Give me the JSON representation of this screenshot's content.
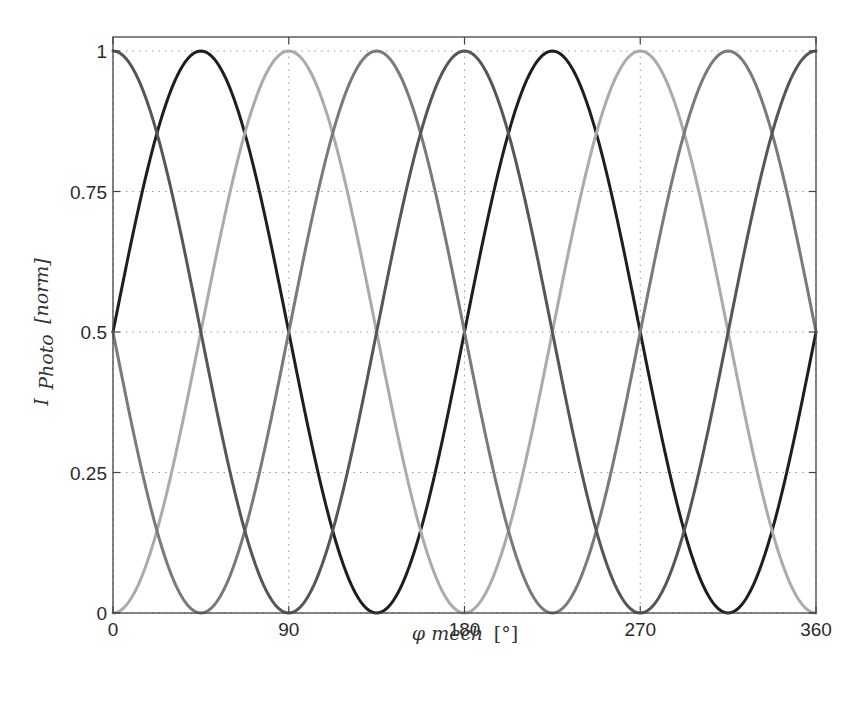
{
  "chart_data": {
    "type": "line",
    "title": "",
    "xlabel": "φ mech [°]",
    "xlabel_parts": {
      "symbol": "φ mech",
      "unit": "[°]"
    },
    "ylabel": "I Photo [norm]",
    "ylabel_parts": {
      "main": "I",
      "subscript": "Photo",
      "unit": "[norm]"
    },
    "xlim": [
      0,
      360
    ],
    "ylim": [
      0,
      1
    ],
    "xticks": [
      0,
      90,
      180,
      270,
      360
    ],
    "xtick_labels": [
      "0",
      "90",
      "180",
      "270",
      "360"
    ],
    "yticks": [
      0,
      0.25,
      0.5,
      0.75,
      1
    ],
    "ytick_labels": [
      "0",
      "0.25",
      "0.5",
      "0.75",
      "1"
    ],
    "grid": true,
    "legend": null,
    "x": [
      0,
      22.5,
      45,
      67.5,
      90,
      112.5,
      135,
      157.5,
      180,
      202.5,
      225,
      247.5,
      270,
      292.5,
      315,
      337.5,
      360
    ],
    "series": [
      {
        "name": "photodiode-1 (dark)",
        "color": "#1e1e1e",
        "formula": "0.5 + 0.5*sin(2*phi)",
        "values": [
          0.5,
          0.854,
          1.0,
          0.854,
          0.5,
          0.146,
          0.0,
          0.146,
          0.5,
          0.854,
          1.0,
          0.854,
          0.5,
          0.146,
          0.0,
          0.146,
          0.5
        ]
      },
      {
        "name": "photodiode-2 (light gray)",
        "color": "#ababab",
        "formula": "0.5 - 0.5*cos(2*phi)",
        "values": [
          0.0,
          0.146,
          0.5,
          0.854,
          1.0,
          0.854,
          0.5,
          0.146,
          0.0,
          0.146,
          0.5,
          0.854,
          1.0,
          0.854,
          0.5,
          0.146,
          0.0
        ]
      },
      {
        "name": "photodiode-3 (medium gray)",
        "color": "#7a7a7a",
        "formula": "0.5 - 0.5*sin(2*phi)",
        "values": [
          0.5,
          0.146,
          0.0,
          0.146,
          0.5,
          0.854,
          1.0,
          0.854,
          0.5,
          0.146,
          0.0,
          0.146,
          0.5,
          0.854,
          1.0,
          0.854,
          0.5
        ]
      },
      {
        "name": "photodiode-4 (dark gray)",
        "color": "#565656",
        "formula": "0.5 + 0.5*cos(2*phi)",
        "values": [
          1.0,
          0.854,
          0.5,
          0.146,
          0.0,
          0.146,
          0.5,
          0.854,
          1.0,
          0.854,
          0.5,
          0.146,
          0.0,
          0.146,
          0.5,
          0.854,
          1.0
        ]
      }
    ]
  },
  "layout": {
    "plot_left": 113,
    "plot_right": 816,
    "plot_top": 37,
    "plot_bottom": 613,
    "y_at_1": 51,
    "y_at_0": 613
  }
}
